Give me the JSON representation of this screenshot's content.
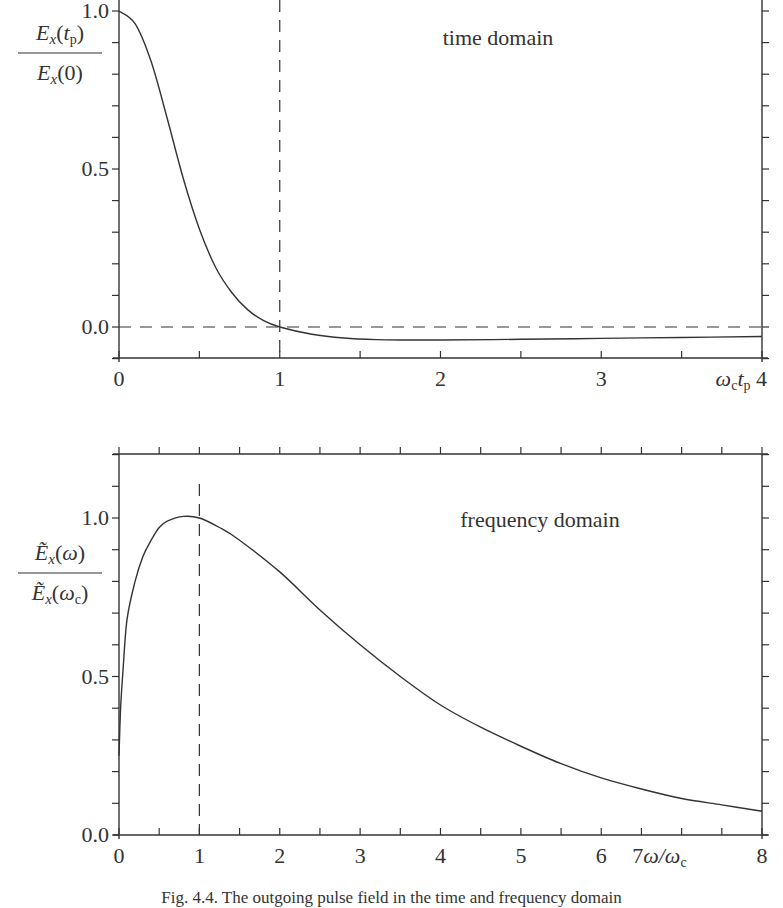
{
  "figure": {
    "caption": "Fig. 4.4. The outgoing pulse field in the time and frequency domain"
  },
  "chart_data": [
    {
      "type": "line",
      "title": "time domain",
      "annotation": "time domain",
      "xlabel": "ω_c t_p",
      "ylabel": "E_x(t_p) / E_x(0)",
      "xlim": [
        0,
        4
      ],
      "ylim": [
        -0.1,
        1.0
      ],
      "xticks": [
        0,
        1,
        2,
        3,
        4
      ],
      "xtick_labels": [
        "0",
        "1",
        "2",
        "3",
        "ωctp 4"
      ],
      "yticks": [
        0.0,
        0.5,
        1.0
      ],
      "ytick_labels": [
        "0.0",
        "0.5",
        "1.0"
      ],
      "minor_xtick_step": 0.5,
      "minor_ytick_step": 0.1,
      "grid": false,
      "reference_lines": [
        {
          "orientation": "vertical",
          "x": 1,
          "style": "dashed"
        },
        {
          "orientation": "horizontal",
          "y": 0,
          "style": "dashed"
        }
      ],
      "series": [
        {
          "name": "E_x(t_p)/E_x(0)",
          "x": [
            0,
            0.1,
            0.2,
            0.3,
            0.4,
            0.5,
            0.6,
            0.7,
            0.8,
            0.9,
            1.0,
            1.2,
            1.4,
            1.6,
            1.8,
            2.0,
            2.5,
            3.0,
            3.5,
            4.0
          ],
          "y": [
            1.0,
            0.96,
            0.84,
            0.66,
            0.47,
            0.31,
            0.19,
            0.11,
            0.055,
            0.02,
            0.0,
            -0.023,
            -0.035,
            -0.04,
            -0.041,
            -0.041,
            -0.039,
            -0.036,
            -0.033,
            -0.03
          ]
        }
      ]
    },
    {
      "type": "line",
      "title": "frequency domain",
      "annotation": "frequency domain",
      "xlabel": "ω/ω_c",
      "ylabel": "Ẽ_x(ω) / Ẽ_x(ω_c)",
      "xlim": [
        0,
        8
      ],
      "ylim": [
        0.0,
        1.2
      ],
      "xticks": [
        0,
        1,
        2,
        3,
        4,
        5,
        6,
        7,
        8
      ],
      "xtick_labels": [
        "0",
        "1",
        "2",
        "3",
        "4",
        "5",
        "6",
        "7ω/ωc",
        "8"
      ],
      "yticks": [
        0.0,
        0.5,
        1.0
      ],
      "ytick_labels": [
        "0.0",
        "0.5",
        "1.0"
      ],
      "minor_xtick_step": 0.5,
      "minor_ytick_step": 0.1,
      "grid": false,
      "reference_lines": [
        {
          "orientation": "vertical",
          "x": 1,
          "style": "dashed"
        }
      ],
      "series": [
        {
          "name": "Ẽ_x(ω)/Ẽ_x(ω_c)",
          "x": [
            0,
            0.02,
            0.05,
            0.1,
            0.2,
            0.3,
            0.4,
            0.5,
            0.6,
            0.8,
            1.0,
            1.25,
            1.5,
            2.0,
            2.5,
            3.0,
            3.5,
            4.0,
            4.5,
            5.0,
            5.5,
            6.0,
            6.5,
            7.0,
            7.5,
            8.0
          ],
          "y": [
            0.25,
            0.4,
            0.52,
            0.68,
            0.8,
            0.88,
            0.93,
            0.97,
            0.99,
            1.005,
            1.0,
            0.97,
            0.93,
            0.83,
            0.71,
            0.6,
            0.5,
            0.41,
            0.34,
            0.28,
            0.225,
            0.18,
            0.145,
            0.115,
            0.095,
            0.075
          ]
        }
      ]
    }
  ]
}
